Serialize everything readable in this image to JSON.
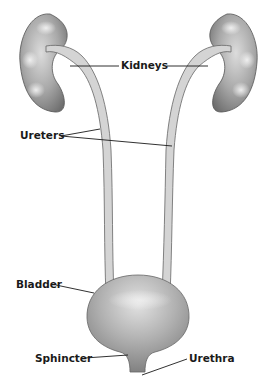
{
  "diagram": {
    "labels": {
      "kidneys": "Kidneys",
      "ureters": "Ureters",
      "bladder": "Bladder",
      "sphincter": "Sphincter",
      "urethra": "Urethra"
    },
    "colors": {
      "organ_fill": "#9e9e9e",
      "organ_highlight": "#e6e6e6",
      "organ_outline": "#555555",
      "ureter_fill": "#d4d4d4",
      "leader_line": "#1a1a1a",
      "background": "#ffffff"
    }
  }
}
